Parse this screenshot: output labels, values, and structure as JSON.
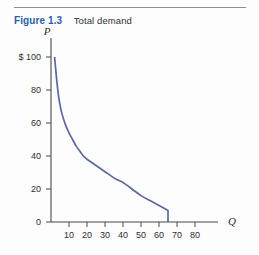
{
  "figure": {
    "number_label": "Figure 1.3",
    "title": "Total demand"
  },
  "colors": {
    "figure_label": "#2b5ea8",
    "title_text": "#333333",
    "curve": "#5a6a9e",
    "axis": "#4a4a4a",
    "rule": "#8d8d8d",
    "background": "#fdfdfd"
  },
  "axes": {
    "y_name": "P",
    "x_name": "Q",
    "y_tick_labels": [
      "0",
      "20",
      "40",
      "60",
      "80",
      "$ 100"
    ],
    "x_tick_labels": [
      "10",
      "20",
      "30",
      "40",
      "50",
      "60",
      "70",
      "80"
    ]
  },
  "chart_data": {
    "type": "line",
    "title": "Total demand",
    "xlabel": "Q",
    "ylabel": "P",
    "xlim": [
      0,
      90
    ],
    "ylim": [
      0,
      110
    ],
    "grid": false,
    "legend": "none",
    "x_ticks": [
      10,
      20,
      30,
      40,
      50,
      60,
      70,
      80
    ],
    "y_ticks": [
      0,
      20,
      40,
      60,
      80,
      100
    ],
    "y_tick_text": [
      "0",
      "20",
      "40",
      "60",
      "80",
      "$ 100"
    ],
    "currency_prefix": "$",
    "series": [
      {
        "name": "Total demand",
        "color": "#5a6a9e",
        "points": [
          [
            2,
            100
          ],
          [
            3,
            88
          ],
          [
            4,
            78
          ],
          [
            5,
            71
          ],
          [
            6,
            66
          ],
          [
            8,
            59
          ],
          [
            10,
            54
          ],
          [
            12,
            50
          ],
          [
            14,
            46
          ],
          [
            16,
            43
          ],
          [
            18,
            40
          ],
          [
            20,
            38
          ],
          [
            24,
            35
          ],
          [
            28,
            32
          ],
          [
            32,
            29
          ],
          [
            36,
            26
          ],
          [
            40,
            24
          ],
          [
            45,
            20
          ],
          [
            50,
            16
          ],
          [
            55,
            13
          ],
          [
            60,
            10
          ],
          [
            65,
            7
          ],
          [
            65,
            0
          ]
        ]
      }
    ],
    "annotations": [
      "Curve is steeply downward sloping near the vertical axis, flattens through the middle, then terminates with a vertical drop to zero at Q = 65."
    ]
  }
}
